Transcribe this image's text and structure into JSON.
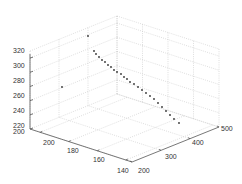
{
  "chart_data": {
    "type": "scatter",
    "projection": "3d",
    "title": "",
    "xlabel": "",
    "ylabel": "",
    "zlabel": "",
    "grid": true,
    "x_axis": {
      "ticks": [
        200,
        300,
        400,
        500
      ],
      "lim": [
        200,
        500
      ]
    },
    "y_axis": {
      "ticks": [
        140,
        160,
        180,
        200
      ],
      "lim": [
        140,
        210
      ]
    },
    "z_axis": {
      "ticks": [
        220,
        240,
        260,
        280,
        300,
        320
      ],
      "lim": [
        220,
        330
      ]
    },
    "marker": "dot",
    "marker_color": "#333333",
    "points_screen": [
      [
        88,
        36
      ],
      [
        62,
        87
      ],
      [
        94,
        51
      ],
      [
        96,
        54
      ],
      [
        99,
        57
      ],
      [
        102,
        60
      ],
      [
        105,
        62
      ],
      [
        108,
        65
      ],
      [
        111,
        67
      ],
      [
        114,
        70
      ],
      [
        117,
        72
      ],
      [
        121,
        74
      ],
      [
        124,
        77
      ],
      [
        127,
        79
      ],
      [
        130,
        82
      ],
      [
        134,
        84
      ],
      [
        138,
        87
      ],
      [
        142,
        90
      ],
      [
        146,
        93
      ],
      [
        150,
        96
      ],
      [
        154,
        99
      ],
      [
        158,
        103
      ],
      [
        162,
        107
      ],
      [
        166,
        111
      ],
      [
        170,
        115
      ],
      [
        174,
        119
      ],
      [
        179,
        123
      ]
    ]
  },
  "axes": {
    "z_tick_labels": [
      "320",
      "300",
      "280",
      "260",
      "240",
      "220"
    ],
    "y_tick_labels": [
      "200",
      "180",
      "160",
      "140"
    ],
    "x_tick_labels": [
      "200",
      "300",
      "400",
      "500"
    ],
    "corner_label_z": "220",
    "corner_label_y": "200"
  },
  "colors": {
    "axis": "#555555",
    "grid": "#c8c8c8",
    "background": "#ffffff",
    "marker": "#333333"
  }
}
